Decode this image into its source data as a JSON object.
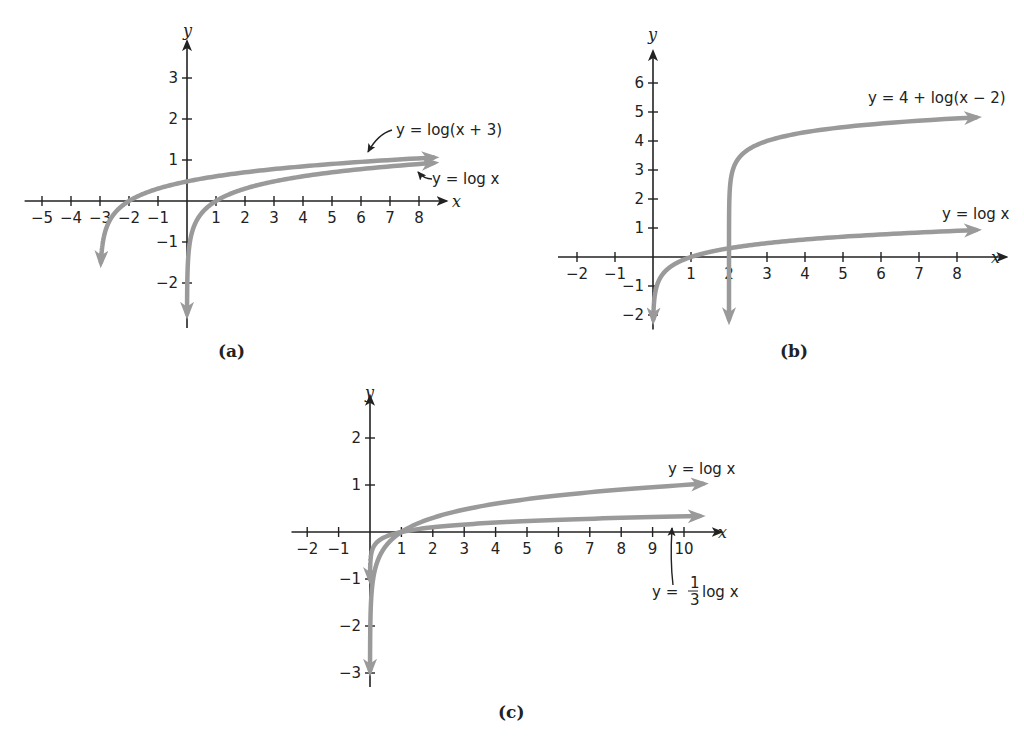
{
  "chart_data": [
    {
      "id": "a",
      "type": "line",
      "caption": "(a)",
      "xlabel": "x",
      "ylabel": "y",
      "xlim": [
        -5.5,
        9
      ],
      "ylim": [
        -3,
        3.8
      ],
      "xticks": [
        -5,
        -4,
        -3,
        -2,
        -1,
        1,
        2,
        3,
        4,
        5,
        6,
        7,
        8
      ],
      "yticks": [
        -2,
        -1,
        1,
        2,
        3
      ],
      "grid": false,
      "series": [
        {
          "name": "y = log(x + 3)",
          "function": "log10(x+3)",
          "x": [
            -2.97,
            -2.9,
            -2.5,
            -2,
            -1,
            0,
            2,
            4,
            6,
            8.7
          ],
          "values": [
            -1.52,
            -1.0,
            -0.3,
            0,
            0.3,
            0.48,
            0.7,
            0.85,
            0.95,
            1.07
          ]
        },
        {
          "name": "y = log x",
          "function": "log10(x)",
          "x": [
            0.01,
            0.1,
            0.5,
            1,
            2,
            4,
            6,
            8.7
          ],
          "values": [
            -2,
            -1,
            -0.3,
            0,
            0.3,
            0.6,
            0.78,
            0.94
          ]
        }
      ],
      "annotations": [
        "y = log(x + 3)",
        "y = log x"
      ]
    },
    {
      "id": "b",
      "type": "line",
      "caption": "(b)",
      "xlabel": "x",
      "ylabel": "y",
      "xlim": [
        -2.5,
        9
      ],
      "ylim": [
        -2.5,
        7
      ],
      "xticks": [
        -2,
        -1,
        1,
        2,
        3,
        4,
        5,
        6,
        7,
        8
      ],
      "yticks": [
        -2,
        -1,
        1,
        2,
        3,
        4,
        5,
        6
      ],
      "grid": false,
      "series": [
        {
          "name": "y = 4 + log(x − 2)",
          "function": "4+log10(x-2)",
          "x": [
            2.0001,
            2.001,
            2.01,
            2.1,
            3,
            4,
            6,
            8.7
          ],
          "values": [
            0,
            1,
            2,
            3,
            4,
            4.3,
            4.6,
            4.83
          ]
        },
        {
          "name": "y = log x",
          "function": "log10(x)",
          "x": [
            0.01,
            0.1,
            0.5,
            1,
            2,
            4,
            6,
            8.7
          ],
          "values": [
            -2,
            -1,
            -0.3,
            0,
            0.3,
            0.6,
            0.78,
            0.94
          ]
        }
      ],
      "annotations": [
        "y = 4 + log(x − 2)",
        "y = log x"
      ]
    },
    {
      "id": "c",
      "type": "line",
      "caption": "(c)",
      "xlabel": "x",
      "ylabel": "y",
      "xlim": [
        -2.5,
        11
      ],
      "ylim": [
        -3.2,
        2.8
      ],
      "xticks": [
        -2,
        -1,
        1,
        2,
        3,
        4,
        5,
        6,
        7,
        8,
        9,
        10
      ],
      "yticks": [
        -3,
        -2,
        -1,
        1,
        2
      ],
      "grid": false,
      "series": [
        {
          "name": "y = log x",
          "function": "log10(x)",
          "x": [
            0.1,
            0.5,
            1,
            2,
            4,
            6,
            8,
            10.8
          ],
          "values": [
            -1,
            -0.3,
            0,
            0.3,
            0.6,
            0.78,
            0.9,
            1.03
          ]
        },
        {
          "name": "y = (1/3) log x",
          "function": "log10(x)/3",
          "x": [
            0.001,
            0.1,
            0.5,
            1,
            2,
            4,
            6,
            8,
            10.8
          ],
          "values": [
            -1,
            -0.33,
            -0.1,
            0,
            0.1,
            0.2,
            0.26,
            0.3,
            0.34
          ]
        }
      ],
      "annotations": [
        "y = log x",
        "y = 1/3 log x"
      ]
    }
  ],
  "labels": {
    "a": {
      "caption": "(a)",
      "eq1": "y = log(x + 3)",
      "eq2": "y = log x",
      "x": "x",
      "y": "y"
    },
    "b": {
      "caption": "(b)",
      "eq1": "y = 4 + log(x − 2)",
      "eq2": "y = log x",
      "x": "x",
      "y": "y"
    },
    "c": {
      "caption": "(c)",
      "eq1": "y = log x",
      "eq2_prefix": "y =",
      "eq2_num": "1",
      "eq2_den": "3",
      "eq2_suffix": "log x",
      "x": "x",
      "y": "y"
    }
  },
  "colors": {
    "curve": "#9a9a9a",
    "axis": "#222222"
  }
}
